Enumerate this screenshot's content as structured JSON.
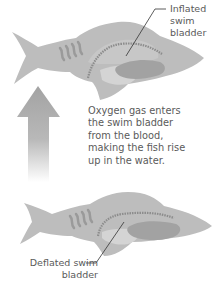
{
  "diagram": {
    "labels": {
      "inflated": "Inflated swim bladder",
      "inflated_lines": [
        "Inflated",
        "swim",
        "bladder"
      ],
      "deflated_lines": [
        "Deflated swim",
        "bladder"
      ]
    },
    "caption_lines": [
      "Oxygen gas enters",
      "the swim bladder",
      "from the blood,",
      "making the fish rise",
      "up in the water."
    ],
    "arrow": {
      "direction": "up",
      "meaning": "fish rises"
    },
    "colors": {
      "fish_body": "#b9b9b9",
      "fish_light": "#d2d2d2",
      "organs": "#9e9e9e",
      "spine": "#8a8a8a",
      "bladder_inflated": "#c8c8c8",
      "arrow": "#a6a6a6",
      "text": "#5a5a5a",
      "leader_line": "#333333"
    }
  }
}
